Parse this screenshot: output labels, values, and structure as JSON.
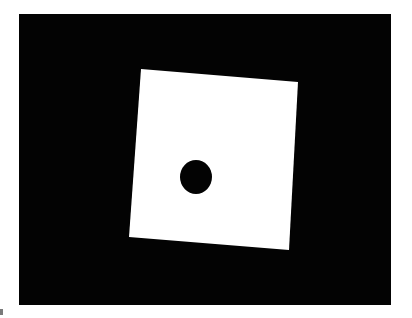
{
  "image": {
    "description": "White rotated square with a single black dot on a black background (die face showing one pip)",
    "background_color": "#ffffff",
    "frame": {
      "x": 19,
      "y": 14,
      "width": 372,
      "height": 291,
      "color": "#030303"
    },
    "square": {
      "color": "#ffffff",
      "points": "141,69 298,82 289,250 129,237"
    },
    "dot": {
      "color": "#030303",
      "cx": 196,
      "cy": 177,
      "rx": 16,
      "ry": 17
    }
  }
}
